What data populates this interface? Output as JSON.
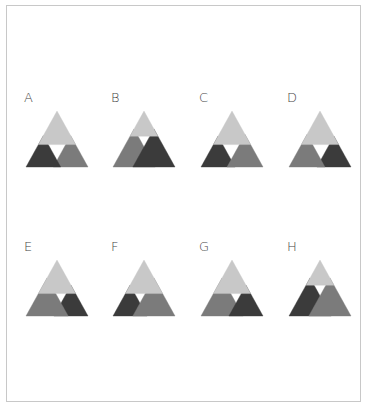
{
  "colors": {
    "light": "#c8c8c8",
    "medium": "#7b7b7b",
    "dark": "#3b3b3b",
    "hole": "#ffffff",
    "frame": "#c8c8c8"
  },
  "options": [
    {
      "label": "A",
      "x": 24,
      "y": 90,
      "top": 0.6,
      "left": {
        "color": "dark",
        "s": 0.56
      },
      "right": {
        "color": "medium",
        "s": 0.56
      },
      "front": "left"
    },
    {
      "label": "B",
      "x": 111,
      "y": 90,
      "top": 0.45,
      "left": {
        "color": "medium",
        "s": 0.68
      },
      "right": {
        "color": "dark",
        "s": 0.68
      },
      "front": "right"
    },
    {
      "label": "C",
      "x": 199,
      "y": 90,
      "top": 0.6,
      "left": {
        "color": "dark",
        "s": 0.55
      },
      "right": {
        "color": "medium",
        "s": 0.58
      },
      "front": "right"
    },
    {
      "label": "D",
      "x": 287,
      "y": 90,
      "top": 0.6,
      "left": {
        "color": "medium",
        "s": 0.58
      },
      "right": {
        "color": "dark",
        "s": 0.55
      },
      "front": "left"
    },
    {
      "label": "E",
      "x": 24,
      "y": 239,
      "top": 0.6,
      "left": {
        "color": "medium",
        "s": 0.68
      },
      "right": {
        "color": "dark",
        "s": 0.55
      },
      "front": "left"
    },
    {
      "label": "F",
      "x": 111,
      "y": 239,
      "top": 0.6,
      "left": {
        "color": "dark",
        "s": 0.55
      },
      "right": {
        "color": "medium",
        "s": 0.68
      },
      "front": "right"
    },
    {
      "label": "G",
      "x": 199,
      "y": 239,
      "top": 0.6,
      "left": {
        "color": "medium",
        "s": 0.68
      },
      "right": {
        "color": "dark",
        "s": 0.55
      },
      "front": "right"
    },
    {
      "label": "H",
      "x": 287,
      "y": 239,
      "top": 0.45,
      "left": {
        "color": "dark",
        "s": 0.68
      },
      "right": {
        "color": "medium",
        "s": 0.68
      },
      "front": "right"
    }
  ]
}
